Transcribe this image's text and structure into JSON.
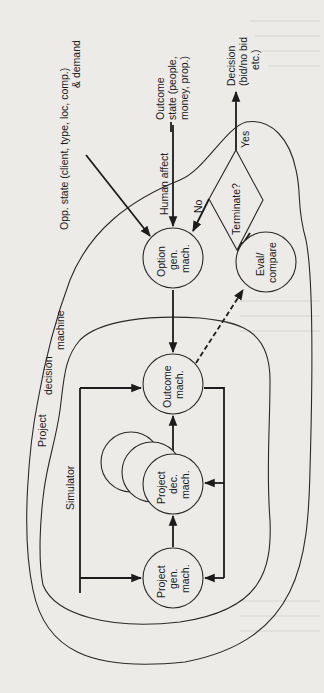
{
  "diagram": {
    "orientation": "rotated 90° counterclockwise (labels read bottom-to-top)",
    "regions": {
      "project_decision_machine": {
        "label_line1": "Project",
        "label_line2": "decision",
        "label_line3": "machine"
      },
      "simulator": {
        "label": "Simulator"
      }
    },
    "nodes": {
      "project_gen": {
        "line1": "Project",
        "line2": "gen.",
        "line3": "mach."
      },
      "project_dec": {
        "line1": "Project",
        "line2": "dec.",
        "line3": "mach."
      },
      "outcome": {
        "line1": "Outcome",
        "line2": "mach."
      },
      "option_gen": {
        "line1": "Option",
        "line2": "gen.",
        "line3": "mach."
      },
      "eval_compare": {
        "line1": "Eval/",
        "line2": "compare"
      },
      "terminate": {
        "label": "Terminate?"
      }
    },
    "inputs": {
      "opp_state": {
        "line1": "Opp. state (client, type, loc, comp.)",
        "line2": "& demand"
      },
      "human_affect": {
        "label": "Human affect"
      },
      "outcome_state": {
        "line1": "Outcome",
        "line2": "state (people,",
        "line3": "money, prop.)"
      }
    },
    "outputs": {
      "decision": {
        "line1": "Decision",
        "line2": "(bid/no bid",
        "line3": "etc.)"
      }
    },
    "edge_labels": {
      "yes": "Yes",
      "no": "No"
    },
    "edges": [
      {
        "from": "Simulator",
        "to": "Project gen. mach.",
        "style": "solid"
      },
      {
        "from": "Simulator",
        "to": "Outcome mach.",
        "style": "solid"
      },
      {
        "from": "Project gen. mach.",
        "to": "Project dec. mach.",
        "style": "solid"
      },
      {
        "from": "Project dec. mach.",
        "to": "Outcome mach.",
        "style": "solid"
      },
      {
        "from": "Outcome mach.",
        "to": "Project dec. mach.",
        "style": "solid feedback"
      },
      {
        "from": "Outcome mach.",
        "to": "Project gen. mach.",
        "style": "solid feedback"
      },
      {
        "from": "Option gen. mach.",
        "to": "Outcome mach.",
        "style": "solid"
      },
      {
        "from": "Outcome mach.",
        "to": "Eval/compare",
        "style": "dashed"
      },
      {
        "from": "Eval/compare",
        "to": "Terminate?",
        "style": "solid"
      },
      {
        "from": "Terminate?",
        "to": "Option gen. mach.",
        "label": "No",
        "style": "solid"
      },
      {
        "from": "Terminate?",
        "to": "Decision (bid/no bid etc.)",
        "label": "Yes",
        "style": "solid"
      },
      {
        "from": "Opp. state",
        "to": "Option gen. mach.",
        "style": "solid"
      },
      {
        "from": "Human affect",
        "to": "Option gen. mach.",
        "style": "solid"
      }
    ]
  }
}
